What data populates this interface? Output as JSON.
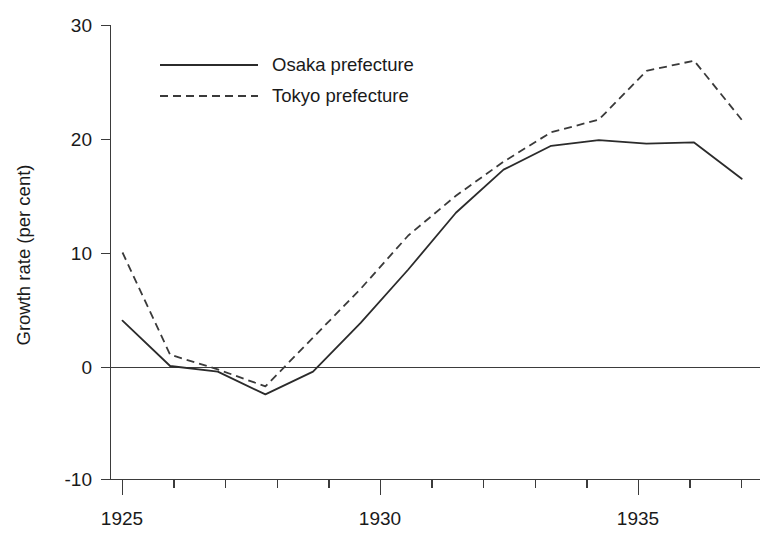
{
  "chart_data": {
    "type": "line",
    "title": "",
    "xlabel": "",
    "ylabel": "Growth rate (per cent)",
    "x": [
      1925,
      1926,
      1927,
      1928,
      1929,
      1930,
      1931,
      1932,
      1933,
      1934,
      1935,
      1936,
      1937,
      1938
    ],
    "xlim": [
      1925,
      1938
    ],
    "ylim": [
      -10,
      30
    ],
    "grid": false,
    "legend_position": "top-center",
    "x_tick_labels": [
      "1925",
      "1930",
      "1935"
    ],
    "x_tick_values": [
      1925,
      1930,
      1935
    ],
    "x_minor_ticks": [
      1926,
      1927,
      1928,
      1929,
      1931,
      1932,
      1933,
      1934,
      1936,
      1937,
      1938
    ],
    "y_tick_labels": [
      "30",
      "20",
      "10",
      "0",
      "-10"
    ],
    "y_tick_values": [
      30,
      20,
      10,
      0,
      -10
    ],
    "zero_reference_line": 0,
    "series": [
      {
        "name": "Osaka prefecture",
        "style": "solid",
        "color": "#2b2b2b",
        "values": [
          4.0,
          0.0,
          -0.5,
          -2.5,
          -0.5,
          3.8,
          8.5,
          13.5,
          17.3,
          19.4,
          19.9,
          19.6,
          19.7,
          16.5
        ]
      },
      {
        "name": "Tokyo prefecture",
        "style": "dashed",
        "color": "#3a3a3a",
        "values": [
          10.0,
          1.0,
          -0.3,
          -1.8,
          2.5,
          6.8,
          11.5,
          15.0,
          18.0,
          20.6,
          21.7,
          26.0,
          26.9,
          21.7
        ]
      }
    ]
  },
  "legend": {
    "entries": [
      {
        "label": "Osaka prefecture",
        "style": "solid"
      },
      {
        "label": "Tokyo prefecture",
        "style": "dashed"
      }
    ]
  }
}
